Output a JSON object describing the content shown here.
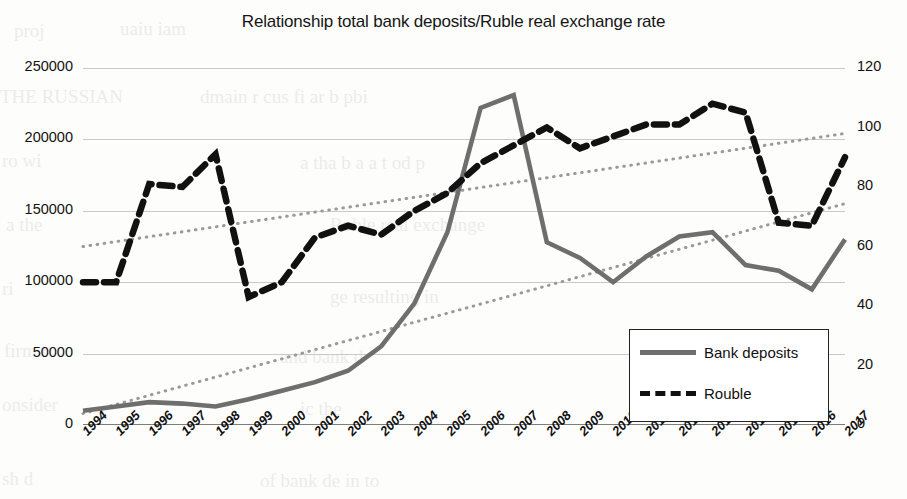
{
  "chart_data": {
    "type": "line",
    "title": "Relationship total bank deposits/Ruble real exchange rate",
    "xlabel": "",
    "ylabel": "",
    "grid": true,
    "legend_position": "inside-bottom-right",
    "categories": [
      "1994",
      "1995",
      "1996",
      "1997",
      "1998",
      "1999",
      "2000",
      "2001",
      "2002",
      "2003",
      "2004",
      "2005",
      "2006",
      "2007",
      "2008",
      "2009",
      "2010",
      "2011",
      "2012",
      "2013",
      "2014",
      "2015",
      "2016",
      "2017"
    ],
    "axes": {
      "left": {
        "label": "",
        "ticks": [
          "0",
          "50000",
          "100000",
          "150000",
          "200000",
          "250000"
        ],
        "values": [
          0,
          50000,
          100000,
          150000,
          200000,
          250000
        ],
        "min": 0,
        "max": 250000
      },
      "right": {
        "label": "",
        "ticks": [
          "0",
          "20",
          "40",
          "60",
          "80",
          "100",
          "120"
        ],
        "values": [
          0,
          20,
          40,
          60,
          80,
          100,
          120
        ],
        "min": 0,
        "max": 120
      }
    },
    "series": [
      {
        "name": "Bank deposits",
        "axis": "left",
        "style": "solid",
        "color": "#6e6e6e",
        "values": [
          10000,
          13000,
          16000,
          15000,
          13000,
          18000,
          24000,
          30000,
          38000,
          55000,
          85000,
          135000,
          222000,
          231000,
          128000,
          117000,
          100000,
          118000,
          132000,
          135000,
          112000,
          108000,
          95000,
          130000
        ]
      },
      {
        "name": "Rouble",
        "axis": "right",
        "style": "dashed",
        "color": "#111111",
        "values": [
          48,
          48,
          81,
          80,
          91,
          43,
          48,
          63,
          67,
          64,
          72,
          78,
          88,
          94,
          100,
          93,
          97,
          101,
          101,
          108,
          105,
          68,
          67,
          90
        ]
      }
    ],
    "trendlines": [
      {
        "name": "bank-deposits-trendline",
        "axis": "left",
        "style": "dotted",
        "color": "#9a9a9a",
        "start_value": 8000,
        "end_value": 155000
      },
      {
        "name": "rouble-trendline",
        "axis": "right",
        "style": "dotted",
        "color": "#9a9a9a",
        "start_value": 60,
        "end_value": 98
      }
    ]
  },
  "legend": {
    "items": [
      {
        "label": "Bank deposits",
        "style": "solid"
      },
      {
        "label": "Rouble",
        "style": "dashed"
      }
    ]
  },
  "ghost_text": [
    {
      "x": 14,
      "y": 20,
      "text": "proj"
    },
    {
      "x": 120,
      "y": 18,
      "text": "uaiu  iam"
    },
    {
      "x": 0,
      "y": 86,
      "text": "THE RUSSIAN"
    },
    {
      "x": 200,
      "y": 86,
      "text": "dmain    r cus fi ar b  pbi"
    },
    {
      "x": 2,
      "y": 150,
      "text": "ro wi"
    },
    {
      "x": 300,
      "y": 152,
      "text": "a tha b a a t  od  p"
    },
    {
      "x": 6,
      "y": 214,
      "text": "a the"
    },
    {
      "x": 330,
      "y": 214,
      "text": "Ruble real exchange"
    },
    {
      "x": 2,
      "y": 278,
      "text": "ri"
    },
    {
      "x": 330,
      "y": 286,
      "text": "ge  resulting in"
    },
    {
      "x": 4,
      "y": 340,
      "text": "firm   r"
    },
    {
      "x": 280,
      "y": 346,
      "text": "and bank d"
    },
    {
      "x": 2,
      "y": 394,
      "text": "onsider"
    },
    {
      "x": 300,
      "y": 398,
      "text": "ic  the"
    },
    {
      "x": 2,
      "y": 468,
      "text": "sh d"
    },
    {
      "x": 260,
      "y": 470,
      "text": "of   bank de  in  to"
    }
  ]
}
